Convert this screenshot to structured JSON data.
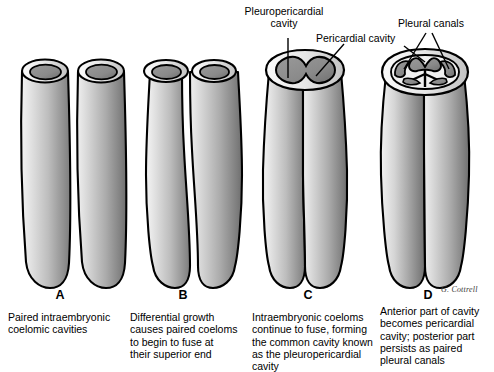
{
  "figure": {
    "signature": "G. Cottrell",
    "background_color": "#ffffff",
    "ink_color": "#000000"
  },
  "callouts": [
    {
      "id": "pleuropericardial",
      "text": "Pleuropericardial\ncavity",
      "points_to": "panel-c-fused-cavity"
    },
    {
      "id": "pericardial",
      "text": "Pericardial cavity",
      "points_to": "panel-d-pericardial-cavity"
    },
    {
      "id": "pleural",
      "text": "Pleural canals",
      "points_to": "panel-d-pleural-canals"
    }
  ],
  "panels": [
    {
      "letter": "A",
      "caption": "Paired intraembryonic\ncoelomic cavities"
    },
    {
      "letter": "B",
      "caption": "Differential growth\ncauses paired coeloms\nto begin to fuse at\ntheir superior end"
    },
    {
      "letter": "C",
      "caption": "Intraembryonic coeloms\ncontinue to fuse, forming\nthe common cavity known\nas the pleuropericardial\ncavity"
    },
    {
      "letter": "D",
      "caption": "Anterior part of cavity\nbecomes pericardial\ncavity; posterior part\npersists as paired\npleural canals"
    }
  ],
  "icons": {
    "leader_line": "leader-line",
    "tube": "coelomic-tube"
  }
}
